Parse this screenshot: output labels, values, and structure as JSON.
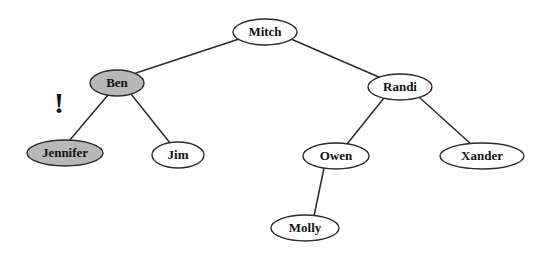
{
  "figure": {
    "background_color": "#ffffff",
    "stroke_color": "#2a2a2a",
    "text_color": "#111111",
    "shaded_fill": "#b8b8b8",
    "plain_fill": "#ffffff",
    "width": 552,
    "height": 257
  },
  "nodes": [
    {
      "id": "mitch",
      "label": "Mitch",
      "cx": 265,
      "cy": 32,
      "rx": 32,
      "ry": 13,
      "font_size": 13,
      "shaded": false,
      "level": 0
    },
    {
      "id": "ben",
      "label": "Ben",
      "cx": 117,
      "cy": 83,
      "rx": 27,
      "ry": 13,
      "font_size": 13,
      "shaded": true,
      "level": 1
    },
    {
      "id": "randi",
      "label": "Randi",
      "cx": 400,
      "cy": 87,
      "rx": 32,
      "ry": 13,
      "font_size": 13,
      "shaded": false,
      "level": 1
    },
    {
      "id": "jennifer",
      "label": "Jennifer",
      "cx": 65,
      "cy": 153,
      "rx": 38,
      "ry": 13,
      "font_size": 13,
      "shaded": true,
      "level": 2
    },
    {
      "id": "jim",
      "label": "Jim",
      "cx": 178,
      "cy": 155,
      "rx": 26,
      "ry": 13,
      "font_size": 13,
      "shaded": false,
      "level": 2
    },
    {
      "id": "owen",
      "label": "Owen",
      "cx": 336,
      "cy": 156,
      "rx": 33,
      "ry": 13,
      "font_size": 13,
      "shaded": false,
      "level": 2
    },
    {
      "id": "xander",
      "label": "Xander",
      "cx": 482,
      "cy": 156,
      "rx": 42,
      "ry": 13,
      "font_size": 13,
      "shaded": false,
      "level": 2
    },
    {
      "id": "molly",
      "label": "Molly",
      "cx": 305,
      "cy": 228,
      "rx": 34,
      "ry": 13,
      "font_size": 13,
      "shaded": false,
      "level": 3
    }
  ],
  "edges": [
    {
      "id": "mitch-ben",
      "from": "mitch",
      "to": "ben",
      "x1": 239,
      "y1": 39,
      "x2": 136,
      "y2": 73
    },
    {
      "id": "mitch-randi",
      "from": "mitch",
      "to": "randi",
      "x1": 291,
      "y1": 39,
      "x2": 381,
      "y2": 78
    },
    {
      "id": "ben-jennifer",
      "from": "ben",
      "to": "jennifer",
      "x1": 108,
      "y1": 95,
      "x2": 69,
      "y2": 141
    },
    {
      "id": "ben-jim",
      "from": "ben",
      "to": "jim",
      "x1": 131,
      "y1": 94,
      "x2": 170,
      "y2": 143
    },
    {
      "id": "randi-owen",
      "from": "randi",
      "to": "owen",
      "x1": 384,
      "y1": 98,
      "x2": 347,
      "y2": 144
    },
    {
      "id": "randi-xander",
      "from": "randi",
      "to": "xander",
      "x1": 420,
      "y1": 98,
      "x2": 471,
      "y2": 144
    },
    {
      "id": "owen-molly",
      "from": "owen",
      "to": "molly",
      "x1": 324,
      "y1": 168,
      "x2": 314,
      "y2": 216
    }
  ],
  "annotations": [
    {
      "id": "exclamation",
      "symbol": "!",
      "x": 59,
      "y": 106,
      "font_size": 30
    }
  ]
}
